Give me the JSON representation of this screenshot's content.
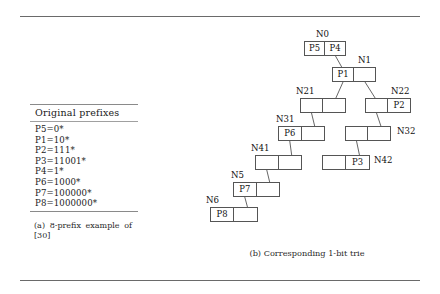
{
  "figure": {
    "rules": [
      "top-rule",
      "bottom-rule"
    ]
  },
  "subfigure_a": {
    "table_header": "Original prefixes",
    "prefixes": [
      "P5=0*",
      "P1=10*",
      "P2=111*",
      "P3=11001*",
      "P4=1*",
      "P6=1000*",
      "P7=100000*",
      "P8=1000000*"
    ],
    "caption": "(a) 8-prefix example of [30]"
  },
  "subfigure_b": {
    "caption": "(b) Corresponding 1-bit trie",
    "nodes": [
      {
        "id": "N0",
        "label": "N0",
        "left": "P5",
        "right": "P4",
        "x": 124,
        "y": 15,
        "w": 42
      },
      {
        "id": "N1",
        "label": "N1",
        "left": "P1",
        "right": "",
        "x": 152,
        "y": 41,
        "w": 44
      },
      {
        "id": "N21",
        "label": "N21",
        "left": "",
        "right": "",
        "x": 120,
        "y": 72,
        "w": 46
      },
      {
        "id": "N22",
        "label": "N22",
        "left": "",
        "right": "P2",
        "x": 185,
        "y": 72,
        "w": 46
      },
      {
        "id": "N31",
        "label": "N31",
        "left": "P6",
        "right": "",
        "x": 98,
        "y": 100,
        "w": 47
      },
      {
        "id": "N32",
        "label": "N32",
        "left": "",
        "right": "",
        "x": 165,
        "y": 100,
        "w": 46
      },
      {
        "id": "N41",
        "label": "N41",
        "left": "",
        "right": "",
        "x": 75,
        "y": 129,
        "w": 47
      },
      {
        "id": "N42",
        "label": "N42",
        "left": "",
        "right": "P3",
        "x": 142,
        "y": 129,
        "w": 48
      },
      {
        "id": "N5",
        "label": "N5",
        "left": "P7",
        "right": "",
        "x": 53,
        "y": 156,
        "w": 47
      },
      {
        "id": "N6",
        "label": "N6",
        "left": "P8",
        "right": "",
        "x": 30,
        "y": 181,
        "w": 48
      }
    ],
    "edges": [
      {
        "from": "N0",
        "bit": "1",
        "to": "N1"
      },
      {
        "from": "N1",
        "bit": "0",
        "to": "N21"
      },
      {
        "from": "N1",
        "bit": "1",
        "to": "N22"
      },
      {
        "from": "N21",
        "bit": "0",
        "to": "N31"
      },
      {
        "from": "N22",
        "bit": "0",
        "to": "N32"
      },
      {
        "from": "N31",
        "bit": "0",
        "to": "N41"
      },
      {
        "from": "N32",
        "bit": "0",
        "to": "N42"
      },
      {
        "from": "N41",
        "bit": "0",
        "to": "N5"
      },
      {
        "from": "N5",
        "bit": "0",
        "to": "N6"
      }
    ]
  },
  "colors": {
    "rule": "#6a6a6a",
    "node_border": "#555555",
    "text": "#111111",
    "background": "#ffffff"
  }
}
